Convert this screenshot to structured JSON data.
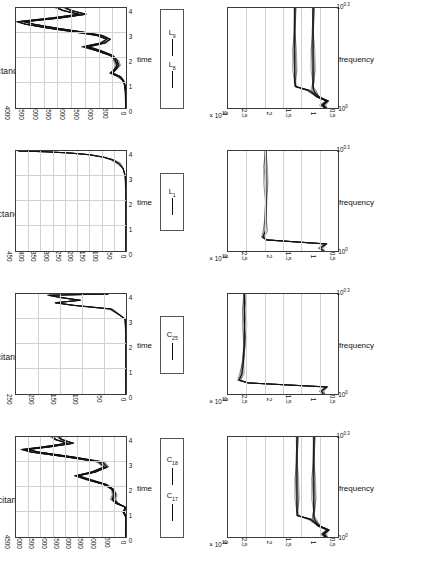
{
  "figure": {
    "orientation": "rotated-90-ccw",
    "rows": 2,
    "cols": 4,
    "background": "#ffffff",
    "line_color": "#111111",
    "grid_color": "#d2d2d2"
  },
  "panels": [
    {
      "id": "capacitances-1-time",
      "title": "capacitances I",
      "xlabel": "time",
      "xticks": [
        "0",
        "1",
        "2",
        "3",
        "4"
      ],
      "yticks": [
        "0",
        "500",
        "1000",
        "1500",
        "2000",
        "2500",
        "3000",
        "3500",
        "4000",
        "4500"
      ],
      "yexp": "",
      "legend": [
        "C17",
        "C18"
      ],
      "legend_labels": [
        {
          "base": "C",
          "sub": "17"
        },
        {
          "base": "C",
          "sub": "18"
        }
      ]
    },
    {
      "id": "capacitances-2-time",
      "title": "capacitances II",
      "xlabel": "time",
      "xticks": [
        "0",
        "1",
        "2",
        "3",
        "4"
      ],
      "yticks": [
        "0",
        "50",
        "100",
        "150",
        "200",
        "250"
      ],
      "yexp": "",
      "legend": [
        "C25"
      ],
      "legend_labels": [
        {
          "base": "C",
          "sub": "25"
        }
      ]
    },
    {
      "id": "inductances-1-time",
      "title": "inductances I",
      "xlabel": "time",
      "xticks": [
        "0",
        "1",
        "2",
        "3",
        "4"
      ],
      "yticks": [
        "0",
        "50",
        "100",
        "150",
        "200",
        "250",
        "300",
        "350",
        "400",
        "450"
      ],
      "yexp": "",
      "legend": [
        "L1"
      ],
      "legend_labels": [
        {
          "base": "L",
          "sub": "1"
        }
      ]
    },
    {
      "id": "inductances-2-time",
      "title": "inductances II",
      "xlabel": "time",
      "xticks": [
        "0",
        "1",
        "2",
        "3",
        "4"
      ],
      "yticks": [
        "0",
        "500",
        "1000",
        "1500",
        "2000",
        "2500",
        "3000",
        "3500",
        "4000"
      ],
      "yexp": "",
      "legend": [
        "L8",
        "L9"
      ],
      "legend_labels": [
        {
          "base": "L",
          "sub": "8"
        },
        {
          "base": "L",
          "sub": "9"
        }
      ]
    },
    {
      "id": "capacitances-1-frequency",
      "title": "",
      "xlabel": "frequency",
      "xticks": [
        "10^0",
        "10^0.3"
      ],
      "yticks": [
        "0.5",
        "1",
        "1.5",
        "2",
        "2.5",
        "3"
      ],
      "yexp": "x 10^10",
      "legend": [],
      "legend_labels": []
    },
    {
      "id": "capacitances-2-frequency",
      "title": "",
      "xlabel": "frequency",
      "xticks": [
        "10^0",
        "10^0.3"
      ],
      "yticks": [
        "0.5",
        "1",
        "1.5",
        "2",
        "2.5",
        "3"
      ],
      "yexp": "x 10^10",
      "legend": [],
      "legend_labels": []
    },
    {
      "id": "inductances-1-frequency",
      "title": "",
      "xlabel": "frequency",
      "xticks": [
        "10^0",
        "10^0.3"
      ],
      "yticks": [
        "0.5",
        "1",
        "1.5",
        "2",
        "2.5",
        "3"
      ],
      "yexp": "x 10^10",
      "legend": [],
      "legend_labels": []
    },
    {
      "id": "inductances-2-frequency",
      "title": "",
      "xlabel": "frequency",
      "xticks": [
        "10^0",
        "10^0.3"
      ],
      "yticks": [
        "0.5",
        "1",
        "1.5",
        "2",
        "2.5",
        "3"
      ],
      "yexp": "x 10^10",
      "legend": [],
      "legend_labels": []
    }
  ],
  "chart_data": [
    {
      "type": "line",
      "id": "capacitances-1-time",
      "title": "capacitances I",
      "xlabel": "time",
      "ylabel": "",
      "xlim": [
        0,
        4
      ],
      "ylim": [
        0,
        4500
      ],
      "grid": true,
      "legend": [
        "C_17",
        "C_18"
      ],
      "legend_position": "below-axes",
      "series": [
        {
          "name": "C_17",
          "x": [
            0,
            0.2,
            0.5,
            0.8,
            1.0,
            1.1,
            1.2,
            1.35,
            1.5,
            1.7,
            1.9,
            2.1,
            2.3,
            2.45,
            2.6,
            2.8,
            3.0,
            3.2,
            3.4,
            3.5,
            3.6,
            3.75,
            3.9,
            4.0
          ],
          "y": [
            0,
            0,
            0,
            10,
            120,
            60,
            40,
            420,
            560,
            480,
            560,
            900,
            1600,
            2050,
            1400,
            900,
            1100,
            2400,
            3900,
            4250,
            3400,
            2400,
            2900,
            3000
          ]
        },
        {
          "name": "C_18",
          "x": [
            0,
            0.2,
            0.5,
            0.8,
            1.0,
            1.1,
            1.2,
            1.35,
            1.5,
            1.7,
            1.9,
            2.1,
            2.3,
            2.45,
            2.6,
            2.8,
            3.0,
            3.2,
            3.4,
            3.5,
            3.6,
            3.75,
            3.9,
            4.0
          ],
          "y": [
            0,
            0,
            0,
            5,
            80,
            40,
            30,
            350,
            500,
            430,
            500,
            820,
            1500,
            1950,
            1250,
            780,
            950,
            2150,
            3600,
            4050,
            3150,
            2150,
            2650,
            2750
          ]
        }
      ]
    },
    {
      "type": "line",
      "id": "capacitances-2-time",
      "title": "capacitances II",
      "xlabel": "time",
      "ylabel": "",
      "xlim": [
        0,
        4
      ],
      "ylim": [
        0,
        250
      ],
      "grid": true,
      "legend": [
        "C_25"
      ],
      "legend_position": "below-axes",
      "series": [
        {
          "name": "C_25",
          "x": [
            0,
            0.5,
            1.0,
            1.5,
            2.0,
            2.5,
            3.0,
            3.2,
            3.4,
            3.55,
            3.65,
            3.75,
            3.85,
            3.95,
            4.0
          ],
          "y": [
            0,
            0,
            0,
            0,
            0,
            0,
            2,
            18,
            35,
            120,
            160,
            105,
            145,
            175,
            40
          ]
        }
      ]
    },
    {
      "type": "line",
      "id": "inductances-1-time",
      "title": "inductances I",
      "xlabel": "time",
      "ylabel": "",
      "xlim": [
        0,
        4
      ],
      "ylim": [
        0,
        450
      ],
      "grid": true,
      "legend": [
        "L_1"
      ],
      "legend_position": "below-axes",
      "series": [
        {
          "name": "L_1",
          "x": [
            0,
            0.5,
            1.0,
            1.5,
            2.0,
            2.5,
            3.0,
            3.3,
            3.5,
            3.65,
            3.75,
            3.85,
            3.92,
            3.97,
            4.0
          ],
          "y": [
            0,
            0,
            0,
            0,
            0,
            0,
            3,
            12,
            30,
            55,
            90,
            150,
            230,
            330,
            440
          ]
        }
      ]
    },
    {
      "type": "line",
      "id": "inductances-2-time",
      "title": "inductances II",
      "xlabel": "time",
      "ylabel": "",
      "xlim": [
        0,
        4
      ],
      "ylim": [
        0,
        4000
      ],
      "grid": true,
      "legend": [
        "L_8",
        "L_9"
      ],
      "legend_position": "below-axes",
      "series": [
        {
          "name": "L_8",
          "x": [
            0,
            0.3,
            0.7,
            0.95,
            1.1,
            1.25,
            1.4,
            1.55,
            1.7,
            1.9,
            2.1,
            2.3,
            2.45,
            2.6,
            2.75,
            2.9,
            3.05,
            3.2,
            3.35,
            3.45,
            3.6,
            3.75,
            3.9,
            4.0
          ],
          "y": [
            0,
            0,
            20,
            60,
            120,
            240,
            560,
            420,
            330,
            380,
            560,
            1100,
            1550,
            900,
            700,
            1050,
            1900,
            2850,
            3650,
            3950,
            2700,
            1700,
            2300,
            2500
          ]
        },
        {
          "name": "L_9",
          "x": [
            0,
            0.3,
            0.7,
            0.95,
            1.1,
            1.25,
            1.4,
            1.55,
            1.7,
            1.9,
            2.1,
            2.3,
            2.45,
            2.6,
            2.75,
            2.9,
            3.05,
            3.2,
            3.35,
            3.45,
            3.6,
            3.75,
            3.9,
            4.0
          ],
          "y": [
            0,
            0,
            15,
            45,
            95,
            200,
            480,
            360,
            280,
            320,
            480,
            950,
            1380,
            760,
            580,
            880,
            1650,
            2550,
            3350,
            3700,
            2400,
            1450,
            2000,
            2200
          ]
        }
      ]
    },
    {
      "type": "line",
      "id": "capacitances-1-frequency",
      "title": "",
      "xlabel": "frequency",
      "ylabel": "x 10^10",
      "xlim": [
        1,
        2.0
      ],
      "xscale": "log",
      "ylim": [
        0,
        3
      ],
      "grid": true,
      "annotations": [
        "x 10^10"
      ],
      "series": [
        {
          "name": "C_17",
          "x": [
            1.0,
            1.02,
            1.05,
            1.08,
            1.1,
            1.13,
            1.16,
            1.2,
            1.3,
            1.5,
            1.7,
            2.0
          ],
          "y": [
            0.35,
            0.42,
            0.28,
            0.55,
            0.62,
            0.75,
            1.1,
            1.12,
            1.12,
            1.12,
            1.12,
            1.12
          ]
        },
        {
          "name": "C_18",
          "x": [
            1.0,
            1.02,
            1.05,
            1.08,
            1.1,
            1.13,
            1.16,
            1.2,
            1.3,
            1.5,
            1.7,
            2.0
          ],
          "y": [
            0.32,
            0.38,
            0.25,
            0.5,
            0.58,
            0.64,
            0.66,
            0.66,
            0.66,
            0.66,
            0.66,
            0.66
          ]
        }
      ]
    },
    {
      "type": "line",
      "id": "capacitances-2-frequency",
      "title": "",
      "xlabel": "frequency",
      "ylabel": "x 10^10",
      "xlim": [
        1,
        2.0
      ],
      "xscale": "log",
      "ylim": [
        0,
        3
      ],
      "grid": true,
      "annotations": [
        "x 10^10"
      ],
      "series": [
        {
          "name": "C_25",
          "x": [
            1.0,
            1.02,
            1.05,
            1.08,
            1.1,
            1.15,
            1.25,
            1.4,
            1.6,
            1.8,
            2.0
          ],
          "y": [
            0.4,
            0.45,
            0.3,
            2.45,
            2.7,
            2.62,
            2.58,
            2.56,
            2.55,
            2.55,
            2.55
          ]
        }
      ]
    },
    {
      "type": "line",
      "id": "inductances-1-frequency",
      "title": "",
      "xlabel": "frequency",
      "ylabel": "x 10^10",
      "xlim": [
        1,
        2.0
      ],
      "xscale": "log",
      "ylim": [
        0,
        3
      ],
      "grid": true,
      "annotations": [
        "x 10^10"
      ],
      "series": [
        {
          "name": "L_1",
          "x": [
            1.0,
            1.02,
            1.05,
            1.08,
            1.1,
            1.15,
            1.25,
            1.4,
            1.6,
            1.8,
            2.0
          ],
          "y": [
            0.4,
            0.48,
            0.32,
            1.95,
            2.05,
            1.98,
            1.97,
            1.97,
            1.97,
            1.97,
            1.97
          ]
        }
      ]
    },
    {
      "type": "line",
      "id": "inductances-2-frequency",
      "title": "",
      "xlabel": "frequency",
      "ylabel": "x 10^10",
      "xlim": [
        1,
        2.0
      ],
      "xscale": "log",
      "ylim": [
        0,
        3
      ],
      "grid": true,
      "annotations": [
        "x 10^10"
      ],
      "series": [
        {
          "name": "L_8",
          "x": [
            1.0,
            1.02,
            1.05,
            1.08,
            1.1,
            1.13,
            1.16,
            1.2,
            1.3,
            1.5,
            1.7,
            2.0
          ],
          "y": [
            0.35,
            0.44,
            0.3,
            0.58,
            0.66,
            0.8,
            1.15,
            1.18,
            1.18,
            1.18,
            1.18,
            1.18
          ]
        },
        {
          "name": "L_9",
          "x": [
            1.0,
            1.02,
            1.05,
            1.08,
            1.1,
            1.13,
            1.16,
            1.2,
            1.3,
            1.5,
            1.7,
            2.0
          ],
          "y": [
            0.33,
            0.4,
            0.27,
            0.52,
            0.6,
            0.66,
            0.68,
            0.68,
            0.68,
            0.68,
            0.68,
            0.68
          ]
        }
      ]
    }
  ]
}
